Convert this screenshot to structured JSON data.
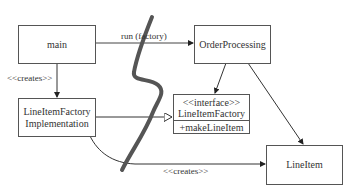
{
  "diagram": {
    "type": "uml-class-dependency",
    "nodes": {
      "main": {
        "label": "main"
      },
      "order_processing": {
        "label": "OrderProcessing"
      },
      "factory_impl": {
        "line1": "LineItemFactory",
        "line2": "Implementation"
      },
      "factory_interface": {
        "stereotype": "<<interface>>",
        "name": "LineItemFactory",
        "operation": "+makeLineItem"
      },
      "line_item": {
        "label": "LineItem"
      }
    },
    "edges": {
      "run_factory": {
        "label": "run (factory)"
      },
      "main_creates": {
        "label": "<<creates>>"
      },
      "impl_creates": {
        "label": "<<creates>>"
      }
    },
    "colors": {
      "line": "#333333",
      "box_border": "#555555",
      "squiggle": "#555555"
    }
  }
}
